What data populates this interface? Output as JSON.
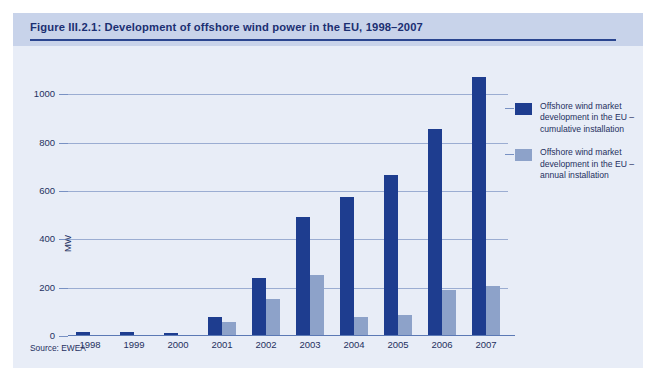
{
  "figure": {
    "title": "Figure III.2.1: Development of offshore wind power in the EU, 1998–2007",
    "source_note": "Source: EWEA"
  },
  "colors": {
    "cumulative": "#1e3d8f",
    "annual": "#8da2c9",
    "panel_background": "#e8edf7",
    "header_background": "#c8d3ea",
    "rule": "#2a458f",
    "grid": "#5b79b5",
    "text": "#1f3060"
  },
  "legend": {
    "position": "right",
    "entries": [
      {
        "name": "cumulative-installation",
        "label": "Offshore wind market development in the EU – cumulative installation",
        "color": "#1e3d8f"
      },
      {
        "name": "annual-installation",
        "label": "Offshore wind market development in the EU – annual installation",
        "color": "#8da2c9"
      }
    ]
  },
  "chart_data": {
    "type": "bar",
    "title": "Figure III.2.1: Development of offshore wind power in the EU, 1998–2007",
    "xlabel": "",
    "ylabel": "MW",
    "ylim": [
      0,
      1100
    ],
    "yticks": [
      0,
      200,
      400,
      600,
      800,
      1000
    ],
    "ytick_labels": [
      "0",
      "200",
      "400",
      "600",
      "800",
      "1000"
    ],
    "grid": true,
    "categories": [
      "1998",
      "1999",
      "2000",
      "2001",
      "2002",
      "2003",
      "2004",
      "2005",
      "2006",
      "2007"
    ],
    "series": [
      {
        "name": "Offshore wind market development in the EU – cumulative installation",
        "color": "#1e3d8f",
        "values": [
          16,
          16,
          14,
          78,
          238,
          492,
          575,
          665,
          858,
          1073
        ]
      },
      {
        "name": "Offshore wind market development in the EU – annual installation",
        "color": "#8da2c9",
        "values": [
          2,
          0,
          2,
          60,
          155,
          254,
          78,
          86,
          192,
          205
        ]
      }
    ]
  }
}
